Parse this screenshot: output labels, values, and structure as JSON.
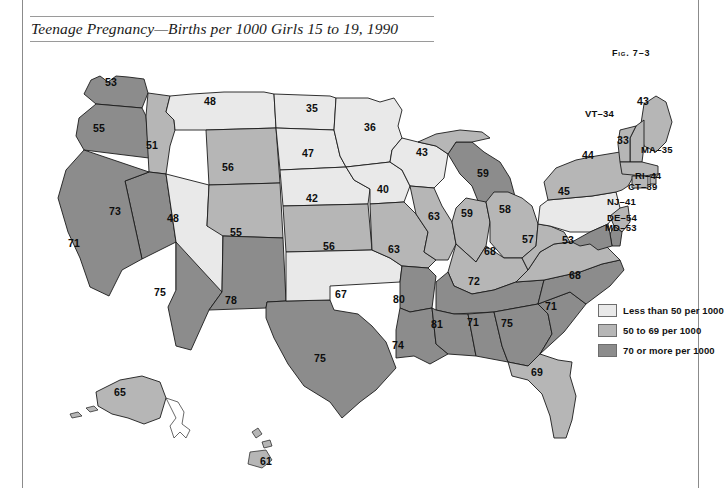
{
  "figure": {
    "title": "Teenage Pregnancy—Births per 1000 Girls 15 to 19, 1990",
    "number": "Fig. 7–3"
  },
  "legend": {
    "items": [
      {
        "label": "Less than 50 per 1000",
        "color": "#e9e9e9",
        "range": [
          0,
          49
        ]
      },
      {
        "label": "50 to 69 per 1000",
        "color": "#b6b6b6",
        "range": [
          50,
          69
        ]
      },
      {
        "label": "70 or more per 1000",
        "color": "#8c8c8c",
        "range": [
          70,
          999
        ]
      }
    ]
  },
  "chart_data": {
    "type": "map",
    "title": "Teenage Pregnancy—Births per 1000 Girls 15 to 19, 1990",
    "unit": "births per 1000 girls aged 15 to 19",
    "year": 1990,
    "bins": [
      "Less than 50 per 1000",
      "50 to 69 per 1000",
      "70 or more per 1000"
    ],
    "bin_colors": [
      "#e9e9e9",
      "#b6b6b6",
      "#8c8c8c"
    ],
    "categories": [
      "WA",
      "OR",
      "ID",
      "MT",
      "WY",
      "NV",
      "CA",
      "UT",
      "CO",
      "AZ",
      "NM",
      "ND",
      "SD",
      "NE",
      "KS",
      "OK",
      "TX",
      "MN",
      "IA",
      "MO",
      "AR",
      "LA",
      "WI",
      "IL",
      "MI",
      "IN",
      "OH",
      "KY",
      "TN",
      "MS",
      "AL",
      "GA",
      "FL",
      "SC",
      "NC",
      "VA",
      "WV",
      "PA",
      "NY",
      "ME",
      "NH",
      "VT",
      "MA",
      "RI",
      "CT",
      "NJ",
      "DE",
      "MD",
      "AK",
      "HI"
    ],
    "values": [
      53,
      55,
      51,
      48,
      56,
      73,
      71,
      48,
      55,
      75,
      78,
      35,
      47,
      42,
      56,
      67,
      75,
      36,
      40,
      63,
      80,
      74,
      43,
      63,
      59,
      59,
      58,
      68,
      72,
      81,
      71,
      75,
      69,
      71,
      68,
      53,
      57,
      45,
      44,
      43,
      33,
      34,
      35,
      44,
      39,
      41,
      54,
      53,
      65,
      61
    ]
  },
  "map": {
    "inline_labels": [
      {
        "state": "WA",
        "value": "53",
        "x": 111,
        "y": 82
      },
      {
        "state": "OR",
        "value": "55",
        "x": 99,
        "y": 128
      },
      {
        "state": "ID",
        "value": "51",
        "x": 152,
        "y": 145
      },
      {
        "state": "MT",
        "value": "48",
        "x": 210,
        "y": 101
      },
      {
        "state": "WY",
        "value": "56",
        "x": 228,
        "y": 167
      },
      {
        "state": "NV",
        "value": "73",
        "x": 115,
        "y": 211
      },
      {
        "state": "CA",
        "value": "71",
        "x": 74,
        "y": 243
      },
      {
        "state": "UT",
        "value": "48",
        "x": 173,
        "y": 218
      },
      {
        "state": "CO",
        "value": "55",
        "x": 236,
        "y": 232
      },
      {
        "state": "AZ",
        "value": "75",
        "x": 160,
        "y": 292
      },
      {
        "state": "NM",
        "value": "78",
        "x": 231,
        "y": 300
      },
      {
        "state": "TX",
        "value": "75",
        "x": 320,
        "y": 358
      },
      {
        "state": "ND",
        "value": "35",
        "x": 312,
        "y": 108
      },
      {
        "state": "SD",
        "value": "47",
        "x": 308,
        "y": 153
      },
      {
        "state": "NE",
        "value": "42",
        "x": 312,
        "y": 198
      },
      {
        "state": "KS",
        "value": "56",
        "x": 329,
        "y": 246
      },
      {
        "state": "OK",
        "value": "67",
        "x": 341,
        "y": 294
      },
      {
        "state": "MN",
        "value": "36",
        "x": 370,
        "y": 127
      },
      {
        "state": "IA",
        "value": "40",
        "x": 383,
        "y": 189
      },
      {
        "state": "MO",
        "value": "63",
        "x": 394,
        "y": 249
      },
      {
        "state": "AR",
        "value": "80",
        "x": 399,
        "y": 299
      },
      {
        "state": "LA",
        "value": "74",
        "x": 398,
        "y": 345
      },
      {
        "state": "WI",
        "value": "43",
        "x": 422,
        "y": 152
      },
      {
        "state": "IL",
        "value": "63",
        "x": 434,
        "y": 216
      },
      {
        "state": "MI",
        "value": "59",
        "x": 483,
        "y": 173
      },
      {
        "state": "IN",
        "value": "59",
        "x": 467,
        "y": 213
      },
      {
        "state": "OH",
        "value": "58",
        "x": 505,
        "y": 209
      },
      {
        "state": "KY",
        "value": "68",
        "x": 490,
        "y": 251
      },
      {
        "state": "TN",
        "value": "72",
        "x": 474,
        "y": 281
      },
      {
        "state": "MS",
        "value": "81",
        "x": 437,
        "y": 324
      },
      {
        "state": "AL",
        "value": "71",
        "x": 473,
        "y": 322
      },
      {
        "state": "GA",
        "value": "75",
        "x": 507,
        "y": 323
      },
      {
        "state": "FL",
        "value": "69",
        "x": 537,
        "y": 372
      },
      {
        "state": "SC",
        "value": "71",
        "x": 551,
        "y": 306
      },
      {
        "state": "NC",
        "value": "68",
        "x": 575,
        "y": 275
      },
      {
        "state": "VA",
        "value": "53",
        "x": 568,
        "y": 240
      },
      {
        "state": "WV",
        "value": "57",
        "x": 528,
        "y": 239
      },
      {
        "state": "PA",
        "value": "45",
        "x": 564,
        "y": 191
      },
      {
        "state": "NY",
        "value": "44",
        "x": 588,
        "y": 155
      },
      {
        "state": "ME",
        "value": "43",
        "x": 643,
        "y": 101
      },
      {
        "state": "NH",
        "value": "33",
        "x": 623,
        "y": 140
      },
      {
        "state": "AK",
        "value": "65",
        "x": 120,
        "y": 392
      },
      {
        "state": "HI",
        "value": "61",
        "x": 266,
        "y": 461
      }
    ],
    "callouts": [
      {
        "state": "VT",
        "text": "VT–34",
        "x": 585,
        "y": 113
      },
      {
        "state": "MA",
        "text": "MA–35",
        "x": 641,
        "y": 149
      },
      {
        "state": "RI",
        "text": "RI–44",
        "x": 635,
        "y": 175
      },
      {
        "state": "CT",
        "text": "CT–39",
        "x": 628,
        "y": 186
      },
      {
        "state": "NJ",
        "text": "NJ–41",
        "x": 607,
        "y": 201
      },
      {
        "state": "DE",
        "text": "DE–54",
        "x": 607,
        "y": 217
      },
      {
        "state": "MD",
        "text": "MD–53",
        "x": 605,
        "y": 227
      }
    ]
  }
}
